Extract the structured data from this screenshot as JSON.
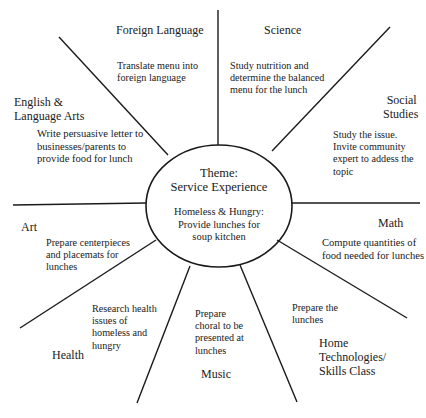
{
  "diagram": {
    "type": "web",
    "center": {
      "title_line1": "Theme:",
      "title_line2": "Service Experience",
      "sub_line1": "Homeless & Hungry:",
      "sub_line2": "Provide lunches for",
      "sub_line3": "soup kitchen"
    },
    "spokes": [
      {
        "subject": [
          "Foreign Language"
        ],
        "activity": [
          "Translate menu into",
          "foreign language"
        ]
      },
      {
        "subject": [
          "Science"
        ],
        "activity": [
          "Study nutrition and",
          "determine the balanced",
          "menu for the lunch"
        ]
      },
      {
        "subject": [
          "Social",
          "Studies"
        ],
        "activity": [
          "Study the issue.",
          "Invite community",
          "expert to addess the",
          "topic"
        ]
      },
      {
        "subject": [
          "Math"
        ],
        "activity": [
          "Compute quantities of",
          "food needed for lunches"
        ]
      },
      {
        "subject": [
          "Home",
          "Technologies/",
          "Skills Class"
        ],
        "activity": [
          "Prepare the",
          "lunches"
        ]
      },
      {
        "subject": [
          "Music"
        ],
        "activity": [
          "Prepare",
          "choral to be",
          "presented at",
          "lunches"
        ]
      },
      {
        "subject": [
          "Health"
        ],
        "activity": [
          "Research health",
          "issues of",
          "homeless and",
          "hungry"
        ]
      },
      {
        "subject": [
          "Art"
        ],
        "activity": [
          "Prepare centerpieces",
          "and placemats for",
          "lunches"
        ]
      },
      {
        "subject": [
          "English &",
          "Language Arts"
        ],
        "activity": [
          "Write persuasive letter to",
          "businesses/parents to",
          "provide food for lunch"
        ]
      }
    ],
    "colors": {
      "line": "#1a1a1a",
      "background": "#ffffff"
    }
  }
}
